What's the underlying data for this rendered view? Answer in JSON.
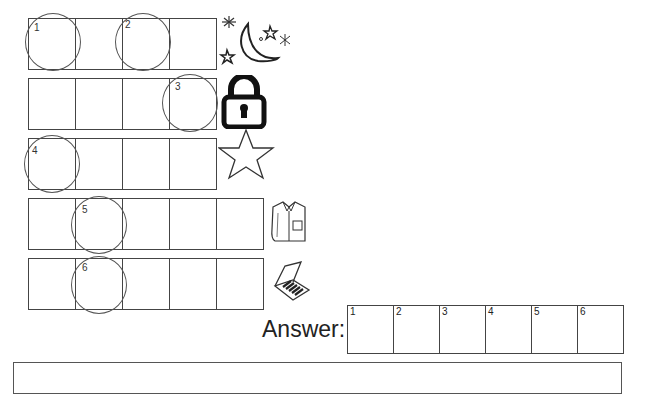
{
  "puzzle": {
    "rows": [
      {
        "cells": 4,
        "picture": "moon-and-stars",
        "marked": [
          {
            "cell": 0,
            "number": "1"
          },
          {
            "cell": 2,
            "number": "2"
          }
        ]
      },
      {
        "cells": 4,
        "picture": "padlock",
        "marked": [
          {
            "cell": 3,
            "number": "3"
          }
        ]
      },
      {
        "cells": 4,
        "picture": "star",
        "marked": [
          {
            "cell": 0,
            "number": "4"
          }
        ]
      },
      {
        "cells": 5,
        "picture": "shirt",
        "marked": [
          {
            "cell": 1,
            "number": "5"
          }
        ]
      },
      {
        "cells": 5,
        "picture": "matchbox",
        "marked": [
          {
            "cell": 1,
            "number": "6"
          }
        ]
      }
    ],
    "labels": {
      "n1": "1",
      "n2": "2",
      "n3": "3",
      "n4": "4",
      "n5": "5",
      "n6": "6"
    }
  },
  "answer": {
    "label": "Answer:",
    "slots": [
      "1",
      "2",
      "3",
      "4",
      "5",
      "6"
    ]
  }
}
